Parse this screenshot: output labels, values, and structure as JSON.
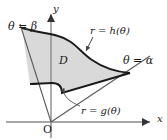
{
  "figure": {
    "labels": {
      "theta_beta": "θ = β",
      "theta_alpha": "θ = α",
      "r_outer": "r = h(θ)",
      "r_inner": "r = g(θ)",
      "region": "D",
      "y_axis": "y",
      "x_axis": "x",
      "origin": "O"
    },
    "colors": {
      "region_fill": "#d9d9d9",
      "curve_stroke": "#1a1a1a",
      "ray_stroke": "#555555",
      "axis_stroke": "#808080",
      "text": "#1a1a1a",
      "background": "#ffffff"
    },
    "geometry": {
      "origin": [
        51,
        122
      ],
      "y_axis_tip": [
        51,
        12
      ],
      "x_axis_tip": [
        154,
        122
      ],
      "ray_beta_tip": [
        22,
        28
      ],
      "ray_alpha_tip": [
        148,
        57
      ],
      "outer_curve_note": "r = h(theta): outer boundary arcs from upper-left over the top and sweeps down to the right tip",
      "inner_curve_note": "r = g(theta): inner boundary, S-shaped, lower-left to the right tip"
    },
    "annotations": [
      {
        "name": "outer-curve-pointer",
        "from": [
          92,
          38
        ],
        "to": [
          86,
          52
        ]
      },
      {
        "name": "inner-curve-pointer",
        "from": [
          80,
          107
        ],
        "to": [
          64,
          87
        ]
      }
    ]
  }
}
